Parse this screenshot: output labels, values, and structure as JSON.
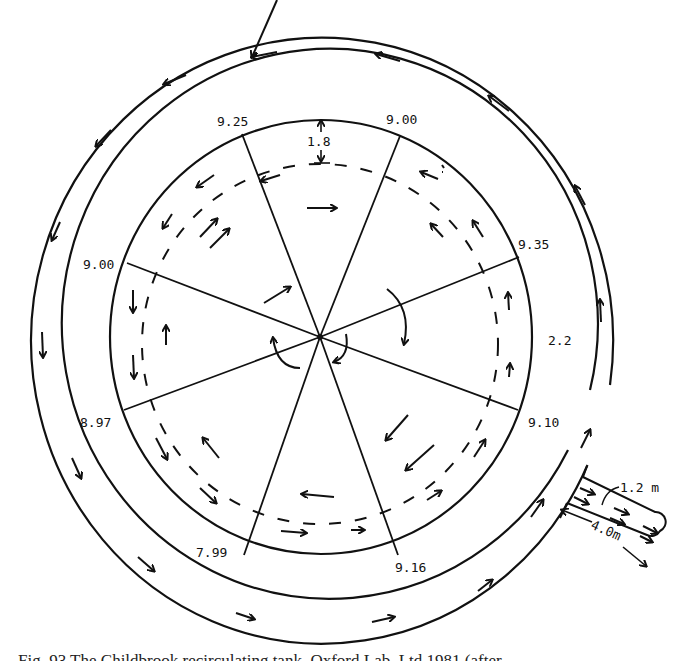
{
  "figure": {
    "type": "plan-view flow diagram of circular tank with outer channel",
    "center": [
      320,
      337
    ],
    "rings": {
      "outer": {
        "rx": 291,
        "ry": 303
      },
      "middle": {
        "rx": 268,
        "ry": 275
      },
      "inner": {
        "rx": 211,
        "ry": 217
      }
    },
    "spokes": [
      {
        "label": "9.25",
        "end": [
          242,
          134
        ],
        "label_pos": [
          217,
          126
        ]
      },
      {
        "label": "9.00",
        "end": [
          400,
          136
        ],
        "label_pos": [
          386,
          124
        ]
      },
      {
        "label": "9.35",
        "end": [
          519,
          257
        ],
        "label_pos": [
          518,
          249
        ]
      },
      {
        "label": "9.10",
        "end": [
          518,
          410
        ],
        "label_pos": [
          528,
          427
        ]
      },
      {
        "label": "9.16",
        "end": [
          398,
          555
        ],
        "label_pos": [
          396,
          572
        ]
      },
      {
        "label": "7.99",
        "end": [
          244,
          555
        ],
        "label_pos": [
          197,
          556
        ]
      },
      {
        "label": "8.97",
        "end": [
          124,
          410
        ],
        "label_pos": [
          80,
          426
        ]
      },
      {
        "label": "9.00",
        "end": [
          127,
          263
        ],
        "label_pos": [
          83,
          268
        ]
      }
    ],
    "dimensions": {
      "top_depth": "1.8",
      "channel_width": "2.2",
      "outlet_width": "1.2 m",
      "outlet_length": "4.0m"
    },
    "caption": "Fig. 93 The Childbrook recirculating tank, Oxford Lab, Ltd 1981 (after..."
  }
}
